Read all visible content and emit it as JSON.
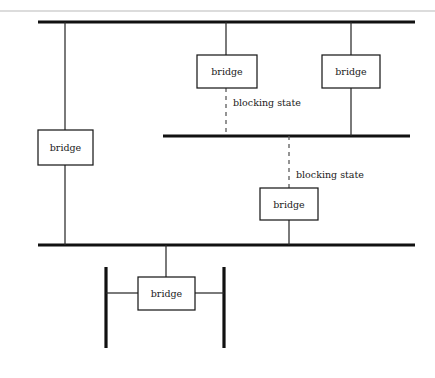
{
  "diagram": {
    "type": "network-topology",
    "canvas": {
      "width": 435,
      "height": 378,
      "background": "#ffffff"
    },
    "colors": {
      "bus": "#111111",
      "link": "#2b2b2b",
      "blocked_link": "#555555",
      "node_stroke": "#1a1a1a",
      "node_fill": "#ffffff",
      "text": "#1a1a1a",
      "hairline": "#b9b9b9"
    },
    "nodes": [
      {
        "id": "bridge-top-middle",
        "label": "bridge",
        "x": 197,
        "y": 55,
        "w": 60,
        "h": 33
      },
      {
        "id": "bridge-top-right",
        "label": "bridge",
        "x": 322,
        "y": 55,
        "w": 58,
        "h": 33
      },
      {
        "id": "bridge-left",
        "label": "bridge",
        "x": 38,
        "y": 130,
        "w": 55,
        "h": 35
      },
      {
        "id": "bridge-middle-lower",
        "label": "bridge",
        "x": 260,
        "y": 188,
        "w": 58,
        "h": 32
      },
      {
        "id": "bridge-bottom",
        "label": "bridge",
        "x": 138,
        "y": 277,
        "w": 57,
        "h": 33
      }
    ],
    "segments": [
      {
        "id": "segment-top",
        "x1": 38,
        "x2": 415,
        "y": 22
      },
      {
        "id": "segment-middle",
        "x1": 163,
        "x2": 410,
        "y": 136
      },
      {
        "id": "segment-lower",
        "x1": 38,
        "x2": 415,
        "y": 245
      },
      {
        "id": "segment-stub-left",
        "x": 106,
        "y1": 267,
        "y2": 348
      },
      {
        "id": "segment-stub-right",
        "x": 224,
        "y1": 267,
        "y2": 348
      }
    ],
    "links": [
      {
        "id": "link-top-to-bridge-left",
        "x": 65,
        "y1": 22,
        "y2": 130
      },
      {
        "id": "link-bridge-left-to-lower",
        "x": 65,
        "y1": 165,
        "y2": 245
      },
      {
        "id": "link-top-to-bridge-top-middle",
        "x": 226,
        "y1": 22,
        "y2": 55
      },
      {
        "id": "link-top-to-bridge-top-right",
        "x": 351,
        "y1": 22,
        "y2": 55
      },
      {
        "id": "link-bridge-top-right-to-middle",
        "x": 351,
        "y1": 88,
        "y2": 136
      },
      {
        "id": "link-bridge-middle-lower-to-lower",
        "x": 289,
        "y1": 220,
        "y2": 245
      },
      {
        "id": "link-lower-to-bridge-bottom",
        "x": 166,
        "y1": 245,
        "y2": 277
      },
      {
        "id": "link-stub-left-to-bridge-bottom",
        "y": 293,
        "x1": 106,
        "x2": 138
      },
      {
        "id": "link-bridge-bottom-to-stub-right",
        "y": 293,
        "x1": 195,
        "x2": 224
      }
    ],
    "blocked_links": [
      {
        "id": "blocked-link-upper",
        "x": 226,
        "y1": 88,
        "y2": 136,
        "label": "blocking state",
        "label_x": 233,
        "label_y": 103
      },
      {
        "id": "blocked-link-lower",
        "x": 289,
        "y1": 136,
        "y2": 188,
        "label": "blocking state",
        "label_x": 296,
        "label_y": 175
      }
    ],
    "decorations": [
      {
        "id": "page-hairline",
        "x1": 0,
        "x2": 435,
        "y": 11
      }
    ]
  }
}
